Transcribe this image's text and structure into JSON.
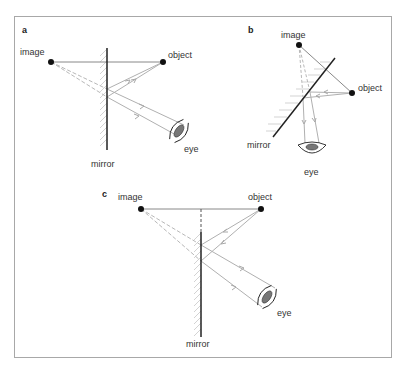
{
  "figure": {
    "panels": [
      {
        "id": "a",
        "label": "a",
        "image_label": "image",
        "object_label": "object",
        "mirror_label": "mirror",
        "eye_label": "eye",
        "mirror_orientation": "vertical"
      },
      {
        "id": "b",
        "label": "b",
        "image_label": "image",
        "object_label": "object",
        "mirror_label": "mirror",
        "eye_label": "eye",
        "mirror_orientation": "diagonal"
      },
      {
        "id": "c",
        "label": "c",
        "image_label": "image",
        "object_label": "object",
        "mirror_label": "mirror",
        "eye_label": "eye",
        "mirror_orientation": "vertical-short"
      }
    ],
    "colors": {
      "mirror": "#222222",
      "object_line": "#888888",
      "ray": "#b0b0b0",
      "virtual_ray": "#b8b8b8",
      "hatch": "#c8c8c8",
      "eye_iris": "#777777",
      "frame": "#a8a8a8"
    }
  }
}
